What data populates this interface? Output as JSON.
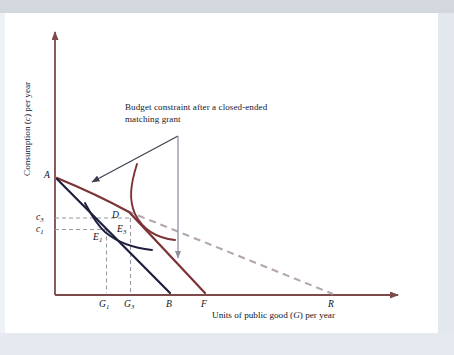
{
  "figure": {
    "kind": "economics-indifference-curve-diagram",
    "background_color": "#ffffff",
    "plate_border_color": "#e3e7ee"
  },
  "axes": {
    "y_title_prefix": "Consumption (",
    "y_title_var": "c",
    "y_title_suffix": ") per year",
    "y_title_full": "Consumption (c) per year",
    "x_title_prefix": "Units of public good (",
    "x_title_var": "G",
    "x_title_suffix": ") per year",
    "x_title_full": "Units of public good (G) per year",
    "axis_color": "#7d4a4c",
    "origin_px": [
      55,
      295
    ],
    "y_top_px": 28,
    "x_right_px": 404
  },
  "annotation": {
    "line1": "Budget constraint after a closed-ended",
    "line2": "matching grant",
    "text_color": "#17172a",
    "diagonal_arrow_color": "#3c3c50",
    "vertical_arrow_color": "#9a9aa8"
  },
  "axis_value_labels": [
    {
      "name": "c3",
      "base": "c",
      "sub": "3",
      "x": 36,
      "y": 212
    },
    {
      "name": "c1",
      "base": "c",
      "sub": "1",
      "x": 36,
      "y": 224
    }
  ],
  "x_tick_labels": [
    {
      "name": "G1",
      "base": "G",
      "sub": "1",
      "x": 99,
      "y": 299
    },
    {
      "name": "G3",
      "base": "G",
      "sub": "3",
      "x": 129,
      "y": 299
    },
    {
      "name": "B",
      "base": "B",
      "sub": "",
      "x": 166,
      "y": 299
    },
    {
      "name": "F",
      "base": "F",
      "sub": "",
      "x": 201,
      "y": 299
    },
    {
      "name": "R",
      "base": "R",
      "sub": "",
      "x": 328,
      "y": 299
    }
  ],
  "point_labels": [
    {
      "name": "A",
      "base": "A",
      "sub": "",
      "x": 44,
      "y": 170
    },
    {
      "name": "D",
      "base": "D",
      "sub": "",
      "x": 112,
      "y": 210
    },
    {
      "name": "E1",
      "base": "E",
      "sub": "1",
      "x": 94,
      "y": 232
    },
    {
      "name": "E3",
      "base": "E",
      "sub": "3",
      "x": 118,
      "y": 224
    }
  ],
  "curves": {
    "budget_initial": {
      "label": "A to B (initial budget constraint)",
      "color": "#1d1f3d",
      "width": 2.1,
      "from": [
        57,
        178
      ],
      "to": [
        170,
        293
      ]
    },
    "budget_matching": {
      "label": "A to F (closed-ended matching grant constraint)",
      "color": "#7d3236",
      "width": 2.1,
      "kink": [
        130,
        213
      ],
      "from": [
        57,
        178
      ],
      "to": [
        205,
        293
      ]
    },
    "budget_openended_dashed": {
      "label": "extension toward R (open-ended / unconstrained match)",
      "color": "#b3a6ad",
      "width": 2.0,
      "dash": "7,5",
      "from": [
        130,
        213
      ],
      "to": [
        333,
        294
      ]
    },
    "indifference_1": {
      "label": "indifference curve through E1",
      "color": "#1d1f3d",
      "width": 1.9
    },
    "indifference_3": {
      "label": "indifference curve through E3",
      "color": "#7d3236",
      "width": 1.9
    }
  },
  "dashed_guides": {
    "color": "#9a9aa8",
    "width": 1.1,
    "dash": "4,3",
    "items": [
      {
        "name": "c3-horizontal",
        "from": [
          55,
          218
        ],
        "to": [
          130,
          218
        ]
      },
      {
        "name": "c1-horizontal",
        "from": [
          55,
          229
        ],
        "to": [
          106,
          229
        ]
      },
      {
        "name": "G1-vertical",
        "from": [
          106,
          229
        ],
        "to": [
          106,
          293
        ]
      },
      {
        "name": "G3-vertical",
        "from": [
          130,
          218
        ],
        "to": [
          130,
          293
        ]
      }
    ]
  }
}
